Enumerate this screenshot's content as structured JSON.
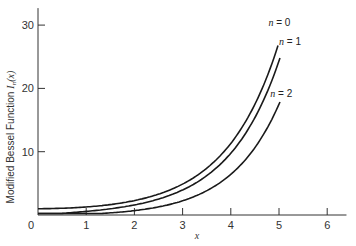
{
  "chart_data": {
    "type": "line",
    "title": "",
    "xlabel": "x",
    "ylabel": "Modified Bessel Function I_n(x)",
    "ylabel_prefix": "Modified Bessel Function ",
    "ylabel_symbol": "I",
    "ylabel_sub": "n",
    "ylabel_arg": "(x)",
    "xlim": [
      0,
      6.4
    ],
    "ylim": [
      0,
      33
    ],
    "x_ticks": [
      0,
      1,
      2,
      3,
      4,
      5,
      6
    ],
    "x_tick_labels": [
      "0",
      "1",
      "2",
      "3",
      "4",
      "5",
      "6"
    ],
    "y_ticks": [
      10,
      20,
      30
    ],
    "y_tick_labels": [
      "10",
      "20",
      "30"
    ],
    "grid": false,
    "legend": "inline labels at curve ends",
    "x": [
      0,
      0.5,
      1,
      1.5,
      2,
      2.5,
      3,
      3.5,
      4,
      4.5,
      5
    ],
    "series": [
      {
        "name": "n = 0",
        "values": [
          1.0,
          1.06,
          1.27,
          1.65,
          2.28,
          3.29,
          4.88,
          7.38,
          11.3,
          17.5,
          27.2
        ]
      },
      {
        "name": "n = 1",
        "values": [
          0.0,
          0.26,
          0.57,
          0.98,
          1.59,
          2.52,
          3.95,
          6.21,
          9.76,
          15.4,
          24.3
        ]
      },
      {
        "name": "n = 2",
        "values": [
          0.0,
          0.03,
          0.14,
          0.34,
          0.69,
          1.28,
          2.25,
          3.83,
          6.42,
          10.6,
          17.5
        ]
      }
    ]
  }
}
